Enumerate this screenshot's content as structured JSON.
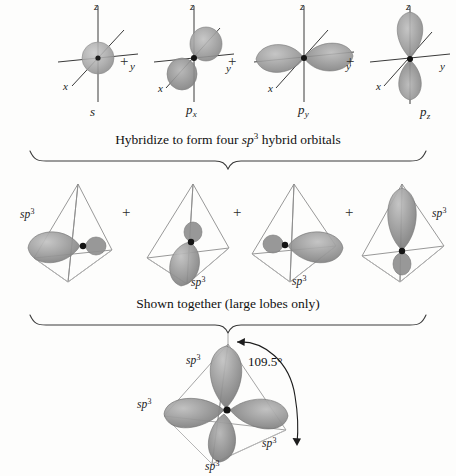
{
  "figure": {
    "background_color": "#fdfdfc",
    "lobe_color": "#8a8a8a",
    "line_color": "#3a3a3a"
  },
  "atomic_orbitals": {
    "row_label": "atomic orbital row",
    "axes": {
      "x": "x",
      "y": "y",
      "z": "z"
    },
    "items": [
      {
        "name": "s-orbital",
        "label_base": "s",
        "label_sub": "",
        "shape": "sphere"
      },
      {
        "name": "px-orbital",
        "label_base": "p",
        "label_sub": "x",
        "shape": "dumbbell-x"
      },
      {
        "name": "py-orbital",
        "label_base": "p",
        "label_sub": "y",
        "shape": "dumbbell-y"
      },
      {
        "name": "pz-orbital",
        "label_base": "p",
        "label_sub": "z",
        "shape": "dumbbell-z"
      }
    ],
    "operators": [
      "+",
      "+",
      "+"
    ]
  },
  "captions": {
    "hybridize": {
      "pre": "Hybridize to form four ",
      "italic": "sp",
      "sup": "3",
      "post": " hybrid orbitals",
      "plain": "Hybridize to form four sp3 hybrid orbitals"
    },
    "shown_together": {
      "plain": "Shown together (large lobes only)"
    }
  },
  "hybrid_orbitals": {
    "row_label": "sp3 hybrid orbital row",
    "count": 4,
    "label_base": "sp",
    "label_sup": "3",
    "items": [
      {
        "name": "sp3-hybrid-1",
        "label_position": "upper-left",
        "lobe_direction": "left"
      },
      {
        "name": "sp3-hybrid-2",
        "label_position": "lower-right",
        "lobe_direction": "down-front"
      },
      {
        "name": "sp3-hybrid-3",
        "label_position": "lower-center",
        "lobe_direction": "right"
      },
      {
        "name": "sp3-hybrid-4",
        "label_position": "upper-right",
        "lobe_direction": "up"
      }
    ],
    "operators": [
      "+",
      "+",
      "+"
    ]
  },
  "combined": {
    "name": "combined-sp3-tetrahedron",
    "label_base": "sp",
    "label_sup": "3",
    "labels": [
      {
        "position": "top-left"
      },
      {
        "position": "left"
      },
      {
        "position": "bottom"
      },
      {
        "position": "bottom-right"
      }
    ],
    "bond_angle": "109.5°",
    "annotation": "tetrahedral bond angle between adjacent sp3 hybrid orbitals"
  }
}
